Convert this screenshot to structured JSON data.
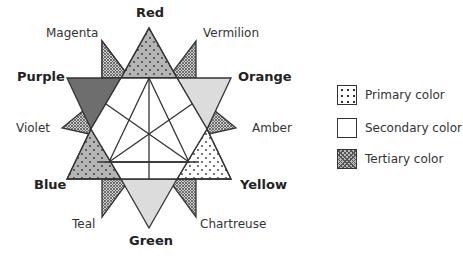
{
  "diagram": {
    "labels": {
      "primary": [
        {
          "name": "Red",
          "x": 136,
          "y": 4
        },
        {
          "name": "Yellow",
          "x": 240,
          "y": 177
        },
        {
          "name": "Blue",
          "x": 34,
          "y": 177
        }
      ],
      "secondary": [
        {
          "name": "Orange",
          "x": 240,
          "y": 69
        },
        {
          "name": "Green",
          "x": 129,
          "y": 233
        },
        {
          "name": "Purple",
          "x": 18,
          "y": 69
        }
      ],
      "tertiary": [
        {
          "name": "Vermilion",
          "x": 203,
          "y": 27
        },
        {
          "name": "Amber",
          "x": 252,
          "y": 122
        },
        {
          "name": "Chartreuse",
          "x": 200,
          "y": 218
        },
        {
          "name": "Teal",
          "x": 72,
          "y": 218
        },
        {
          "name": "Violet",
          "x": 16,
          "y": 122
        },
        {
          "name": "Magenta",
          "x": 46,
          "y": 27
        }
      ]
    }
  },
  "legend": {
    "items": [
      {
        "label": "Primary color",
        "pattern": "dots"
      },
      {
        "label": "Secondary color",
        "pattern": "plain"
      },
      {
        "label": "Tertiary color",
        "pattern": "crosshatch"
      }
    ]
  },
  "colors": {
    "stroke": "#333333",
    "red_fill": "#b5b5b5",
    "blue_fill": "#b5b5b5",
    "yellow_fill": "#ffffff",
    "purple_fill": "#6e6e6e",
    "orange_fill": "#dcdcdc",
    "green_fill": "#dcdcdc",
    "tertiary_fill": "#9a9a9a"
  }
}
